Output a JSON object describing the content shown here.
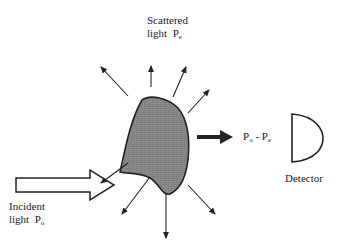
{
  "diagram": {
    "scattered_label": {
      "line1": "Scattered",
      "line2_text": "light",
      "symbol": "P",
      "subscript": "e"
    },
    "incident_label": {
      "line1": "Incident",
      "line2_text": "light",
      "symbol": "P",
      "subscript": "o"
    },
    "transmitted_label": {
      "p1": "P",
      "p1_sub": "o",
      "minus": "-",
      "p2": "P",
      "p2_sub": "e"
    },
    "detector_label": "Detector",
    "colors": {
      "particle_fill": "#8a8a8a",
      "stroke": "#222222",
      "background": "#ffffff"
    }
  }
}
